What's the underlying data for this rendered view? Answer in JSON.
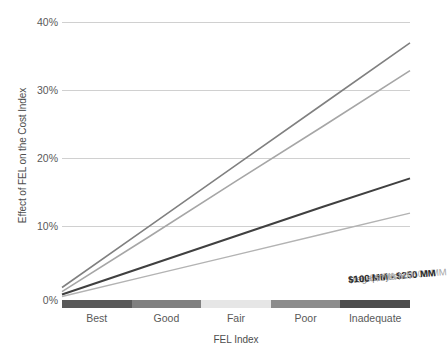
{
  "chart_data": {
    "type": "line",
    "title": "",
    "xlabel": "FEL Index",
    "ylabel": "Effect of FEL on the Cost Index",
    "categories": [
      "Best",
      "Good",
      "Fair",
      "Poor",
      "Inadequate"
    ],
    "ylim": [
      0,
      40
    ],
    "yticks": [
      "0%",
      "10%",
      "20%",
      "30%",
      "40%"
    ],
    "ytick_values": [
      0,
      10,
      20,
      30,
      40
    ],
    "grid": "horizontal",
    "legend_position": "inline-end-of-line",
    "series": [
      {
        "name": "Megaprojects",
        "color": "#808080",
        "values": [
          1.8,
          10.6,
          19.4,
          28.2,
          37.0
        ]
      },
      {
        "name": "$250 MM - $500 MM",
        "color": "#a6a6a6",
        "values": [
          1.2,
          9.1,
          17.1,
          25.0,
          33.0
        ]
      },
      {
        "name": "$100 MM - $250 MM",
        "color": "#404040",
        "values": [
          0.8,
          5.0,
          9.2,
          13.4,
          17.5
        ]
      },
      {
        "name": "< $100 MM",
        "color": "#b3b3b3",
        "values": [
          0.5,
          3.5,
          6.5,
          9.5,
          12.5
        ]
      }
    ],
    "x_axis_strip": [
      {
        "label": "Best",
        "color": "#595959"
      },
      {
        "label": "Good",
        "color": "#808080"
      },
      {
        "label": "Fair",
        "color": "#e6e6e6"
      },
      {
        "label": "Poor",
        "color": "#8c8c8c"
      },
      {
        "label": "Inadequate",
        "color": "#4d4d4d"
      }
    ]
  }
}
